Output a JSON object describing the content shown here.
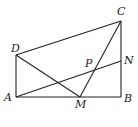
{
  "diagram": {
    "type": "geometry",
    "points": {
      "A": {
        "x": 16,
        "y": 97,
        "label": "A",
        "lx": 4,
        "ly": 101
      },
      "B": {
        "x": 121,
        "y": 97,
        "label": "B",
        "lx": 124,
        "ly": 102
      },
      "C": {
        "x": 121,
        "y": 21,
        "label": "C",
        "lx": 117,
        "ly": 15
      },
      "D": {
        "x": 16,
        "y": 55,
        "label": "D",
        "lx": 11,
        "ly": 52
      },
      "M": {
        "x": 80,
        "y": 97,
        "label": "M",
        "lx": 75,
        "ly": 108
      },
      "N": {
        "x": 121,
        "y": 61,
        "label": "N",
        "lx": 124,
        "ly": 64
      },
      "P": {
        "x": 93,
        "y": 71,
        "label": "P",
        "lx": 85,
        "ly": 67
      }
    },
    "segments": [
      [
        "A",
        "B"
      ],
      [
        "B",
        "C"
      ],
      [
        "C",
        "D"
      ],
      [
        "D",
        "A"
      ],
      [
        "D",
        "M"
      ],
      [
        "M",
        "C"
      ],
      [
        "A",
        "N"
      ]
    ]
  }
}
